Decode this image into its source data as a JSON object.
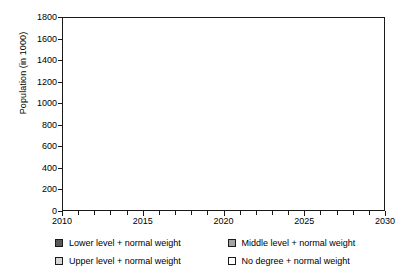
{
  "chart_data": {
    "type": "area",
    "stacked": true,
    "title": "",
    "xlabel": "",
    "ylabel": "Population (in 1000)",
    "xlim": [
      2010,
      2030
    ],
    "ylim": [
      0,
      1800
    ],
    "ytick_step": 200,
    "yticks": [
      0,
      200,
      400,
      600,
      800,
      1000,
      1200,
      1400,
      1600,
      1800
    ],
    "ytick_labels": [
      "0",
      "200",
      "400",
      "600",
      "800",
      "1000",
      "1200",
      "1400",
      "1600",
      "1800"
    ],
    "xticks_major": [
      2010,
      2015,
      2020,
      2025,
      2030
    ],
    "xtick_labels": [
      "2010",
      "2015",
      "2020",
      "2025",
      "2030"
    ],
    "xticks_minor_step": 1,
    "grid": false,
    "legend_position": "bottom",
    "x": [
      2010,
      2011,
      2012,
      2013,
      2014,
      2015,
      2016,
      2017,
      2018,
      2019,
      2020,
      2021,
      2022,
      2023,
      2024,
      2025,
      2026,
      2027,
      2028,
      2029,
      2030
    ],
    "series": [
      {
        "name": "Lower level + normal weight",
        "color": "#595959",
        "values": [
          255,
          262,
          240,
          243,
          238,
          240,
          237,
          234,
          232,
          230,
          228,
          226,
          224,
          222,
          220,
          218,
          214,
          210,
          206,
          200,
          195
        ]
      },
      {
        "name": "Middle level + normal weight",
        "color": "#a3a3a3",
        "values": [
          570,
          512,
          528,
          512,
          535,
          522,
          515,
          510,
          505,
          500,
          497,
          492,
          488,
          482,
          472,
          462,
          450,
          440,
          428,
          414,
          405
        ]
      },
      {
        "name": "Upper level + normal weight",
        "color": "#d6d6d6",
        "values": [
          440,
          478,
          478,
          470,
          452,
          450,
          448,
          444,
          438,
          432,
          425,
          418,
          410,
          402,
          395,
          388,
          382,
          375,
          368,
          362,
          360
        ]
      },
      {
        "name": "No degree + normal weight",
        "color": "#ffffff",
        "values": [
          55,
          53,
          54,
          56,
          58,
          58,
          58,
          57,
          56,
          55,
          54,
          53,
          52,
          52,
          51,
          51,
          50,
          50,
          50,
          50,
          50
        ]
      }
    ],
    "stack_tops": {
      "lower": [
        255,
        262,
        240,
        243,
        238,
        240,
        237,
        234,
        232,
        230,
        228,
        226,
        224,
        222,
        220,
        218,
        214,
        210,
        206,
        200,
        195
      ],
      "middle": [
        825,
        774,
        768,
        755,
        773,
        762,
        752,
        744,
        737,
        730,
        725,
        718,
        712,
        704,
        692,
        680,
        664,
        650,
        634,
        614,
        600
      ],
      "upper": [
        1265,
        1252,
        1246,
        1225,
        1225,
        1212,
        1200,
        1188,
        1175,
        1162,
        1150,
        1136,
        1122,
        1106,
        1087,
        1068,
        1046,
        1025,
        1002,
        976,
        960
      ],
      "total": [
        1320,
        1305,
        1300,
        1281,
        1283,
        1270,
        1258,
        1245,
        1231,
        1217,
        1204,
        1189,
        1174,
        1158,
        1138,
        1119,
        1096,
        1075,
        1052,
        1026,
        1010
      ]
    }
  },
  "legend": {
    "items": [
      {
        "label": "Lower level + normal weight",
        "color": "#595959"
      },
      {
        "label": "Middle level + normal weight",
        "color": "#a3a3a3"
      },
      {
        "label": "Upper level + normal weight",
        "color": "#d6d6d6"
      },
      {
        "label": "No degree + normal weight",
        "color": "#ffffff"
      }
    ]
  }
}
